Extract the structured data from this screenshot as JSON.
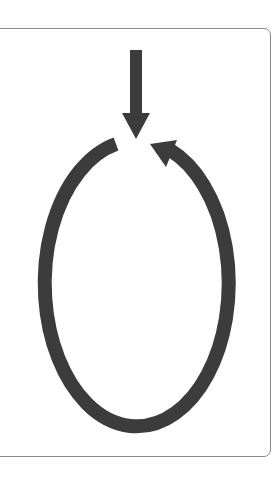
{
  "diagram": {
    "title": "Cycle with entry arrow",
    "description": "A downward arrow entering a clockwise-open loop; a closed oval cycle whose right side ends in an arrowhead pointing back toward the top gap.",
    "colors": {
      "stroke": "#3c3c3c",
      "frame_border": "#8a8a8a",
      "background": "#ffffff"
    },
    "entry_arrow": {
      "icon": "arrow-down-icon",
      "direction": "down"
    },
    "cycle_loop": {
      "icon": "cycle-arrow-icon",
      "direction": "counter-clockwise"
    }
  }
}
